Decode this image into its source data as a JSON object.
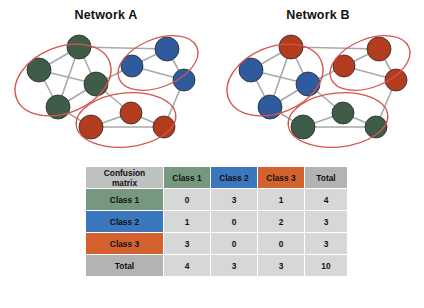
{
  "networks": [
    {
      "id": "network-a",
      "title": "Network A",
      "palette": {
        "green": "#3e5c48",
        "blue": "#2f5b9e",
        "red": "#b33c1e",
        "edge": "#a8aaa9",
        "ellipse": "#d6534c"
      },
      "nodes": [
        {
          "id": "a1",
          "cx": 79,
          "cy": 47,
          "r": 12,
          "color": "green"
        },
        {
          "id": "a2",
          "cx": 39,
          "cy": 70,
          "r": 12,
          "color": "green"
        },
        {
          "id": "a3",
          "cx": 96,
          "cy": 84,
          "r": 12,
          "color": "green"
        },
        {
          "id": "a4",
          "cx": 58,
          "cy": 107,
          "r": 12,
          "color": "green"
        },
        {
          "id": "a5",
          "cx": 132,
          "cy": 66,
          "r": 11,
          "color": "blue"
        },
        {
          "id": "a6",
          "cx": 167,
          "cy": 49,
          "r": 12,
          "color": "blue"
        },
        {
          "id": "a7",
          "cx": 184,
          "cy": 80,
          "r": 11,
          "color": "blue"
        },
        {
          "id": "a8",
          "cx": 91,
          "cy": 127,
          "r": 12,
          "color": "red"
        },
        {
          "id": "a9",
          "cx": 131,
          "cy": 113,
          "r": 11,
          "color": "red"
        },
        {
          "id": "a10",
          "cx": 164,
          "cy": 127,
          "r": 11,
          "color": "red"
        }
      ],
      "edges": [
        [
          "a1",
          "a2"
        ],
        [
          "a1",
          "a3"
        ],
        [
          "a1",
          "a4"
        ],
        [
          "a2",
          "a3"
        ],
        [
          "a2",
          "a4"
        ],
        [
          "a3",
          "a4"
        ],
        [
          "a1",
          "a6"
        ],
        [
          "a3",
          "a5"
        ],
        [
          "a5",
          "a6"
        ],
        [
          "a5",
          "a7"
        ],
        [
          "a6",
          "a7"
        ],
        [
          "a4",
          "a8"
        ],
        [
          "a8",
          "a9"
        ],
        [
          "a8",
          "a10"
        ],
        [
          "a9",
          "a10"
        ],
        [
          "a3",
          "a9"
        ],
        [
          "a7",
          "a10"
        ]
      ],
      "clusters": [
        {
          "id": "cluster-green",
          "cx": 63,
          "cy": 80,
          "rx": 50,
          "ry": 33,
          "rot": -22
        },
        {
          "id": "cluster-blue",
          "cx": 158,
          "cy": 63,
          "rx": 42,
          "ry": 24,
          "rot": -22
        },
        {
          "id": "cluster-red",
          "cx": 126,
          "cy": 120,
          "rx": 50,
          "ry": 27,
          "rot": -6
        }
      ]
    },
    {
      "id": "network-b",
      "title": "Network B",
      "palette": {
        "green": "#3e5c48",
        "blue": "#2f5b9e",
        "red": "#b33c1e",
        "edge": "#a8aaa9",
        "ellipse": "#d6534c"
      },
      "nodes": [
        {
          "id": "b1",
          "cx": 79,
          "cy": 47,
          "r": 12,
          "color": "red"
        },
        {
          "id": "b2",
          "cx": 39,
          "cy": 70,
          "r": 12,
          "color": "blue"
        },
        {
          "id": "b3",
          "cx": 96,
          "cy": 84,
          "r": 12,
          "color": "blue"
        },
        {
          "id": "b4",
          "cx": 58,
          "cy": 107,
          "r": 12,
          "color": "blue"
        },
        {
          "id": "b5",
          "cx": 132,
          "cy": 66,
          "r": 11,
          "color": "red"
        },
        {
          "id": "b6",
          "cx": 167,
          "cy": 49,
          "r": 12,
          "color": "red"
        },
        {
          "id": "b7",
          "cx": 184,
          "cy": 80,
          "r": 11,
          "color": "red"
        },
        {
          "id": "b8",
          "cx": 91,
          "cy": 127,
          "r": 12,
          "color": "green"
        },
        {
          "id": "b9",
          "cx": 131,
          "cy": 113,
          "r": 11,
          "color": "green"
        },
        {
          "id": "b10",
          "cx": 164,
          "cy": 127,
          "r": 11,
          "color": "green"
        }
      ],
      "edges": [
        [
          "b1",
          "b2"
        ],
        [
          "b1",
          "b3"
        ],
        [
          "b1",
          "b4"
        ],
        [
          "b2",
          "b3"
        ],
        [
          "b2",
          "b4"
        ],
        [
          "b3",
          "b4"
        ],
        [
          "b1",
          "b6"
        ],
        [
          "b3",
          "b5"
        ],
        [
          "b5",
          "b6"
        ],
        [
          "b5",
          "b7"
        ],
        [
          "b6",
          "b7"
        ],
        [
          "b4",
          "b8"
        ],
        [
          "b8",
          "b9"
        ],
        [
          "b8",
          "b10"
        ],
        [
          "b9",
          "b10"
        ],
        [
          "b3",
          "b9"
        ],
        [
          "b7",
          "b10"
        ]
      ],
      "clusters": [
        {
          "id": "cluster-blue",
          "cx": 63,
          "cy": 80,
          "rx": 50,
          "ry": 33,
          "rot": -22
        },
        {
          "id": "cluster-red",
          "cx": 158,
          "cy": 63,
          "rx": 42,
          "ry": 24,
          "rot": -22
        },
        {
          "id": "cluster-green",
          "cx": 126,
          "cy": 120,
          "rx": 50,
          "ry": 27,
          "rot": -6
        }
      ]
    }
  ],
  "matrix": {
    "corner_label": "Confusion matrix",
    "corner_label_line1": "Confusion",
    "corner_label_line2": "matrix",
    "column_headers": [
      "Class 1",
      "Class 2",
      "Class 3",
      "Total"
    ],
    "row_headers": [
      "Class 1",
      "Class 2",
      "Class 3",
      "Total"
    ],
    "rows": [
      {
        "header": "Class 1",
        "values": [
          "0",
          "3",
          "1",
          "4"
        ]
      },
      {
        "header": "Class 2",
        "values": [
          "1",
          "0",
          "2",
          "3"
        ]
      },
      {
        "header": "Class 3",
        "values": [
          "3",
          "0",
          "0",
          "3"
        ]
      },
      {
        "header": "Total",
        "values": [
          "4",
          "3",
          "3",
          "10"
        ]
      }
    ],
    "colors": {
      "class1": "#77977f",
      "class2": "#3b77bd",
      "class3": "#d4622f",
      "total": "#b2b4b3",
      "corner": "#bfc1c0",
      "value_cell": "#d6d8d8"
    }
  }
}
